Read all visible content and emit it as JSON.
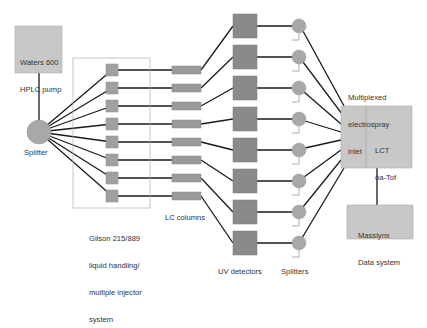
{
  "diagram": {
    "colors": {
      "box_light": "#c8c8c8",
      "box_dark": "#8a8a8a",
      "component": "#9a9a9a",
      "line": "#1a1a1a",
      "border": "#aaaaaa",
      "waste": "#999999"
    },
    "nodes": {
      "pump": {
        "label_line1": "Waters 600",
        "label_line2": "HPLC pump"
      },
      "main_splitter": {
        "label": "Splitter"
      },
      "injector_system": {
        "label_line1": "Gilson 215/889",
        "label_line2": "liquid handling/",
        "label_line3": "multiple injector",
        "label_line4": "system"
      },
      "lc_columns": {
        "label": "LC columns",
        "count": 8
      },
      "uv_detectors": {
        "label": "UV detectors",
        "count": 8
      },
      "splitters": {
        "label": "Splitters",
        "count": 8
      },
      "inlet": {
        "label_line1": "Multiplexed",
        "label_line2": "electrospray",
        "label_line3": "inlet"
      },
      "ms": {
        "label_line1": "LCT",
        "label_line2": "oa-Tof"
      },
      "data_system": {
        "label_line1": "Masslynx",
        "label_line2": "Data system"
      }
    },
    "channels": 8
  }
}
